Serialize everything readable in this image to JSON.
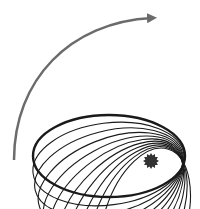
{
  "diagram": {
    "colors": {
      "background": "#ffffff",
      "orbit": "#1a1a1a",
      "arrow": "#6b6b6b",
      "star": "#333333"
    },
    "orbit": {
      "count": 11,
      "rx": 76,
      "ry": 41,
      "pivot": [
        172,
        164
      ],
      "base_center": [
        109,
        156
      ],
      "start_angle_deg": 0,
      "end_angle_deg": -72
    },
    "arrow": {
      "direction": "counterclockwise-visual / rotating upward-right",
      "label": ""
    },
    "star": {
      "cx": 151,
      "cy": 161,
      "r": 8
    }
  }
}
